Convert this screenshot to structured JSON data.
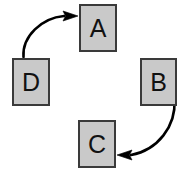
{
  "diagram": {
    "type": "cycle-flow-diagram",
    "background_color": "#ffffff",
    "node_fill_color": "#c9c9c9",
    "node_border_color": "#3a3a3a",
    "arrow_color": "#000000",
    "nodes": [
      {
        "id": "a",
        "label": "A",
        "x": 79,
        "y": 4,
        "width": 38,
        "height": 48
      },
      {
        "id": "b",
        "label": "B",
        "x": 140,
        "y": 58,
        "width": 37,
        "height": 48
      },
      {
        "id": "c",
        "label": "C",
        "x": 78,
        "y": 120,
        "width": 38,
        "height": 48
      },
      {
        "id": "d",
        "label": "D",
        "x": 12,
        "y": 58,
        "width": 38,
        "height": 48
      }
    ],
    "edges": [
      {
        "id": "d-to-a",
        "from": "D",
        "to": "A",
        "direction": "curved-arrow-up-right",
        "arrowhead_at": "A-left-edge"
      },
      {
        "id": "b-to-c",
        "from": "B",
        "to": "C",
        "direction": "curved-arrow-down-left",
        "arrowhead_at": "C-right-edge"
      }
    ]
  }
}
